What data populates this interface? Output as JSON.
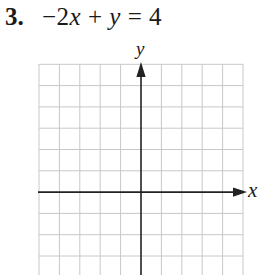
{
  "problem": {
    "number": "3.",
    "equation_parts": {
      "term1_coef": "−2",
      "term1_var": "x",
      "op": " + ",
      "term2_var": "y",
      "rhs": " = 4"
    },
    "equation": "−2x + y = 4"
  },
  "graph": {
    "x_axis_label": "x",
    "y_axis_label": "y",
    "grid_columns": 10,
    "grid_rows": 10,
    "colors": {
      "grid": "#c8c8c8",
      "axis": "#222222"
    }
  }
}
